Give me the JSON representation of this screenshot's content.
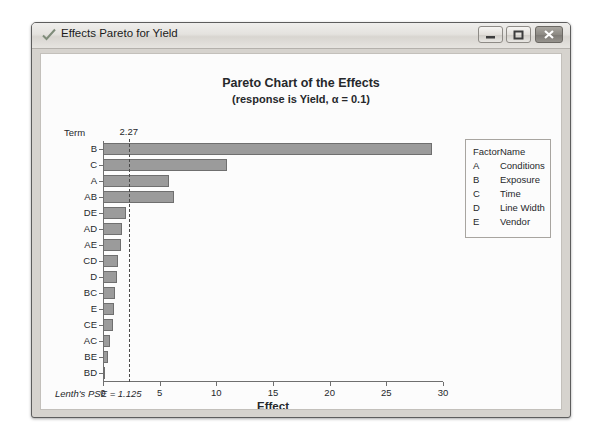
{
  "window": {
    "title": "Effects Pareto for Yield",
    "icon": "checkmark-icon",
    "buttons": {
      "minimize": "Minimize",
      "maximize": "Maximize",
      "close": "Close"
    }
  },
  "chart_data": {
    "type": "bar",
    "orientation": "horizontal",
    "title": "Pareto Chart of the Effects",
    "subtitle": "(response is Yield, α = 0.1)",
    "xlabel": "Effect",
    "ylabel": "Term",
    "categories": [
      "B",
      "C",
      "A",
      "AB",
      "DE",
      "AD",
      "AE",
      "CD",
      "D",
      "BC",
      "E",
      "CE",
      "AC",
      "BE",
      "BD"
    ],
    "values": [
      29.0,
      10.9,
      5.8,
      6.3,
      2.0,
      1.7,
      1.6,
      1.3,
      1.2,
      1.1,
      1.0,
      0.9,
      0.6,
      0.4,
      0.2
    ],
    "xlim": [
      0,
      30
    ],
    "xticks": [
      0,
      5,
      10,
      15,
      20,
      25,
      30
    ],
    "xtick_labels": [
      "0",
      "5",
      "10",
      "15",
      "20",
      "25",
      "30"
    ],
    "reference_line": {
      "value": 2.27,
      "label": "2.27",
      "style": "dashed"
    },
    "grid": false,
    "legend_position": "right",
    "bar_color": "#9b9b9b",
    "bar_border_color": "#6f6f6f",
    "annotation": "Lenth's PSE = 1.125"
  },
  "legend": {
    "headers": [
      "Factor",
      "Name"
    ],
    "rows": [
      {
        "factor": "A",
        "name": "Conditions"
      },
      {
        "factor": "B",
        "name": "Exposure"
      },
      {
        "factor": "C",
        "name": "Time"
      },
      {
        "factor": "D",
        "name": "Line Width"
      },
      {
        "factor": "E",
        "name": "Vendor"
      }
    ]
  }
}
